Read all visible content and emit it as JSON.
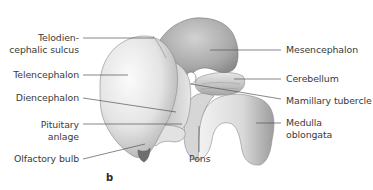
{
  "figure": {
    "panel_label": "b",
    "labels_left": [
      {
        "id": "telodiencephalic-sulcus",
        "line1": "Telodien-",
        "line2": "cephalic sulcus"
      },
      {
        "id": "telencephalon",
        "line1": "Telencephalon"
      },
      {
        "id": "diencephalon",
        "line1": "Diencephalon"
      },
      {
        "id": "pituitary-anlage",
        "line1": "Pituitary",
        "line2": "anlage"
      },
      {
        "id": "olfactory-bulb",
        "line1": "Olfactory bulb"
      }
    ],
    "labels_right": [
      {
        "id": "mesencephalon",
        "line1": "Mesencephalon"
      },
      {
        "id": "cerebellum",
        "line1": "Cerebellum"
      },
      {
        "id": "mamillary-tubercle",
        "line1": "Mamillary tubercle"
      },
      {
        "id": "medulla-oblongata",
        "line1": "Medulla",
        "line2": "oblongata"
      }
    ],
    "labels_bottom": [
      {
        "id": "pons",
        "line1": "Pons"
      }
    ],
    "colors": {
      "leader_line": "#555555",
      "text": "#3a3a3a",
      "tissue_light": "#f2f2f2",
      "tissue_mid": "#c8c8c8",
      "tissue_dark": "#8a8a8a"
    }
  }
}
